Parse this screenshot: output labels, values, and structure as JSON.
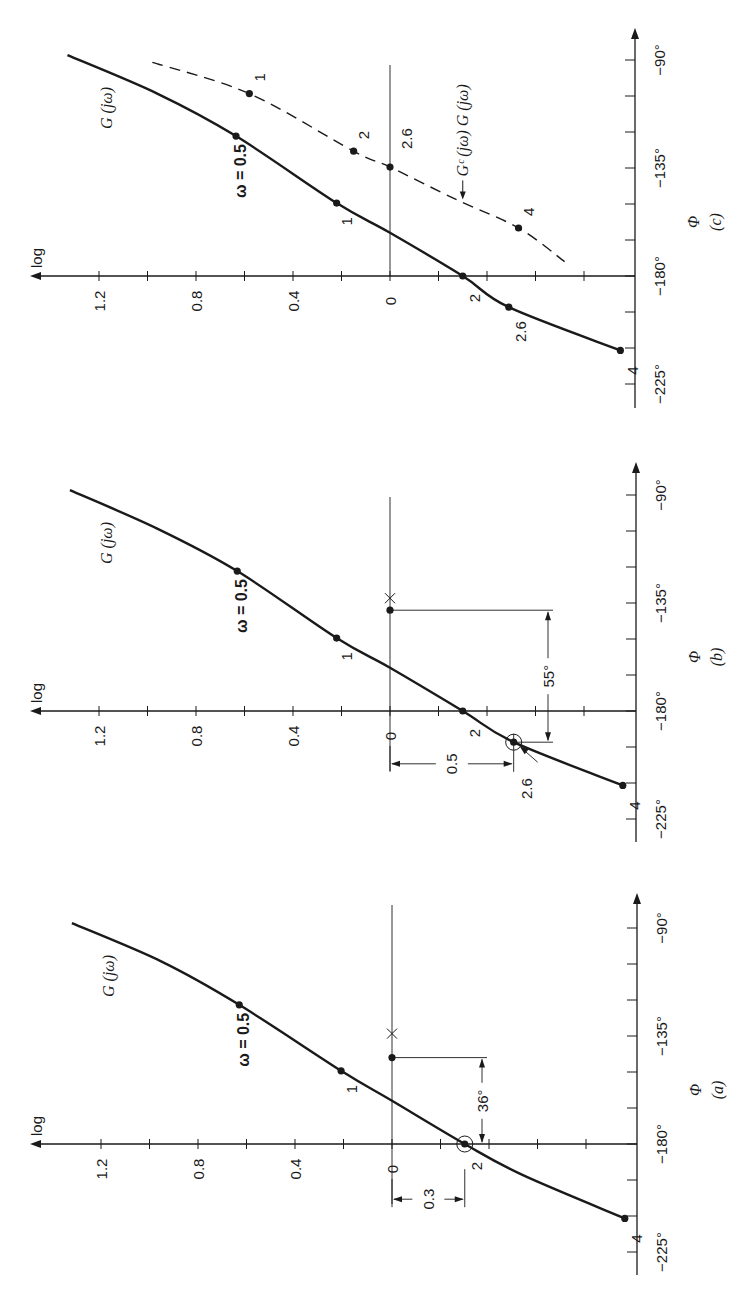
{
  "figure": {
    "ink_color": "#1a1a1a",
    "background": "#ffffff",
    "axis_labels": {
      "magnitude": "log",
      "phase_symbol": "Φ",
      "phase_ticks": [
        "−90°",
        "−135°",
        "−180°",
        "−225°"
      ],
      "magnitude_ticks": [
        "1.2",
        "0.8",
        "0.4",
        "0"
      ]
    }
  },
  "chart_data": [
    {
      "type": "line",
      "panel": "c",
      "caption": "(c)",
      "title": "",
      "xlabel": "Φ",
      "ylabel": "log",
      "xlim": [
        -232,
        -84
      ],
      "ylim": [
        -1.0,
        1.45
      ],
      "x_ticks": [
        -225,
        -210,
        -195,
        -180,
        -165,
        -150,
        -135,
        -120,
        -105,
        -90
      ],
      "x_tick_labels": {
        "-225": "−225°",
        "-180": "−180°",
        "-135": "−135°",
        "-90": "−90°"
      },
      "y_ticks": [
        1.2,
        1.0,
        0.8,
        0.6,
        0.4,
        0.2,
        0,
        -0.2,
        -0.4,
        -0.6,
        -0.8
      ],
      "y_tick_labels": {
        "1.2": "1.2",
        "0.8": "0.8",
        "0.4": "0.4",
        "0": "0"
      },
      "grid": false,
      "reference_line": {
        "log": 0,
        "label": "0"
      },
      "series": [
        {
          "name": "G (jω)",
          "style": "solid",
          "curve": [
            [
              -88,
              1.33
            ],
            [
              -104,
              0.96
            ],
            [
              -121.7,
              0.635
            ],
            [
              -149.6,
              0.22
            ],
            [
              -162,
              0.0
            ],
            [
              -180,
              -0.3
            ],
            [
              -193,
              -0.49
            ],
            [
              -211,
              -0.95
            ]
          ],
          "points": [
            {
              "omega_label": "ω = 0.5",
              "phase": -121.7,
              "log": 0.635
            },
            {
              "omega_label": "1",
              "phase": -149.6,
              "log": 0.22
            },
            {
              "omega_label": "2",
              "phase": -180,
              "log": -0.3
            },
            {
              "omega_label": "2.6",
              "phase": -193,
              "log": -0.49
            },
            {
              "omega_label": "4",
              "phase": -211,
              "log": -0.95
            }
          ]
        },
        {
          "name": "G_c (jω) G (jω)",
          "style": "dashed",
          "curve": [
            [
              -91,
              0.98
            ],
            [
              -104,
              0.58
            ],
            [
              -128,
              0.15
            ],
            [
              -134.6,
              0.0
            ],
            [
              -148,
              -0.27
            ],
            [
              -160,
              -0.53
            ],
            [
              -174,
              -0.72
            ]
          ],
          "points": [
            {
              "omega_label": "1",
              "phase": -104,
              "log": 0.58
            },
            {
              "omega_label": "2",
              "phase": -128,
              "log": 0.15
            },
            {
              "omega_label": "2.6",
              "phase": -134.6,
              "log": 0.0
            },
            {
              "omega_label": "4",
              "phase": -160,
              "log": -0.53
            }
          ]
        }
      ],
      "annotations": [
        {
          "text": "G (jω)",
          "role": "curve-label"
        },
        {
          "text": "← Gᶜ (jω) G (jω)",
          "role": "compensated-curve-label"
        }
      ]
    },
    {
      "type": "line",
      "panel": "b",
      "caption": "(b)",
      "title": "",
      "xlabel": "Φ",
      "ylabel": "log",
      "xlim": [
        -232,
        -84
      ],
      "ylim": [
        -1.0,
        1.45
      ],
      "x_ticks": [
        -225,
        -210,
        -195,
        -180,
        -165,
        -150,
        -135,
        -120,
        -105,
        -90
      ],
      "x_tick_labels": {
        "-225": "−225°",
        "-180": "−180°",
        "-135": "−135°",
        "-90": "−90°"
      },
      "y_ticks": [
        1.2,
        1.0,
        0.8,
        0.6,
        0.4,
        0.2,
        0,
        -0.2,
        -0.4,
        -0.6,
        -0.8
      ],
      "y_tick_labels": {
        "1.2": "1.2",
        "0.8": "0.8",
        "0.4": "0.4",
        "0": "0"
      },
      "grid": false,
      "reference_line": {
        "log": 0,
        "label": "0"
      },
      "series": [
        {
          "name": "G (jω)",
          "style": "solid",
          "curve": [
            [
              -88,
              1.32
            ],
            [
              -104,
              0.96
            ],
            [
              -121.7,
              0.63
            ],
            [
              -149.6,
              0.22
            ],
            [
              -162,
              0.0
            ],
            [
              -180,
              -0.3
            ],
            [
              -193,
              -0.51
            ],
            [
              -211,
              -0.96
            ]
          ],
          "points": [
            {
              "omega_label": "ω = 0.5",
              "phase": -121.7,
              "log": 0.63
            },
            {
              "omega_label": "1",
              "phase": -149.6,
              "log": 0.22
            },
            {
              "omega_label": "2",
              "phase": -180,
              "log": -0.3
            },
            {
              "omega_label": "2.6",
              "phase": -193,
              "log": -0.51,
              "circled": true
            },
            {
              "omega_label": "4",
              "phase": -211,
              "log": -0.96
            }
          ]
        }
      ],
      "markers": [
        {
          "type": "cross",
          "phase": -133,
          "log": 0.0
        },
        {
          "type": "dot",
          "phase": -138,
          "log": 0.0
        }
      ],
      "annotations": [
        {
          "text": "G (jω)",
          "role": "curve-label"
        },
        {
          "text": "55°",
          "role": "phase-margin-dimension",
          "from_phase": -193,
          "to_phase": -138
        },
        {
          "text": "0.5",
          "role": "gain-dimension",
          "from_log": 0.0,
          "to_log": -0.51
        },
        {
          "text": "2.6",
          "role": "arrow-label"
        }
      ]
    },
    {
      "type": "line",
      "panel": "a",
      "caption": "(a)",
      "title": "",
      "xlabel": "Φ",
      "ylabel": "log",
      "xlim": [
        -232,
        -84
      ],
      "ylim": [
        -1.0,
        1.45
      ],
      "x_ticks": [
        -225,
        -210,
        -195,
        -180,
        -165,
        -150,
        -135,
        -120,
        -105,
        -90
      ],
      "x_tick_labels": {
        "-225": "−225°",
        "-180": "−180°",
        "-135": "−135°",
        "-90": "−90°"
      },
      "y_ticks": [
        1.2,
        1.0,
        0.8,
        0.6,
        0.4,
        0.2,
        0,
        -0.2,
        -0.4,
        -0.6,
        -0.8
      ],
      "y_tick_labels": {
        "1.2": "1.2",
        "0.8": "0.8",
        "0.4": "0.4",
        "0": "0"
      },
      "grid": false,
      "reference_line": {
        "log": 0,
        "label": "0"
      },
      "series": [
        {
          "name": "G (jω)",
          "style": "solid",
          "curve": [
            [
              -88,
              1.32
            ],
            [
              -104,
              0.95
            ],
            [
              -122,
              0.63
            ],
            [
              -149.5,
              0.21
            ],
            [
              -162,
              0.0
            ],
            [
              -180,
              -0.3
            ],
            [
              -193,
              -0.54
            ],
            [
              -211,
              -0.96
            ]
          ],
          "points": [
            {
              "omega_label": "ω = 0.5",
              "phase": -122,
              "log": 0.63
            },
            {
              "omega_label": "1",
              "phase": -149.5,
              "log": 0.21
            },
            {
              "omega_label": "2",
              "phase": -180,
              "log": -0.3,
              "circled": true
            },
            {
              "omega_label": "4",
              "phase": -211,
              "log": -0.96
            }
          ]
        }
      ],
      "markers": [
        {
          "type": "cross",
          "phase": -134,
          "log": 0.0
        },
        {
          "type": "dot",
          "phase": -144,
          "log": 0.0
        }
      ],
      "annotations": [
        {
          "text": "G (jω)",
          "role": "curve-label"
        },
        {
          "text": "36°",
          "role": "phase-margin-dimension",
          "from_phase": -180,
          "to_phase": -144
        },
        {
          "text": "0.3",
          "role": "gain-dimension",
          "from_log": 0.0,
          "to_log": -0.3
        }
      ]
    }
  ],
  "panels_layout": [
    {
      "panel": "c",
      "x0": 390,
      "y180": 276,
      "axis_x": 635,
      "arrow_tip_y": 28,
      "axis_bottom_y": 408,
      "ref_top_y": 65,
      "label_y_offset": 0
    },
    {
      "panel": "b",
      "x0": 390,
      "y180": 711,
      "axis_x": 636,
      "arrow_tip_y": 462,
      "axis_bottom_y": 842,
      "ref_top_y": 497,
      "label_y_offset": 0
    },
    {
      "panel": "a",
      "x0": 392,
      "y180": 1144,
      "axis_x": 637,
      "arrow_tip_y": 893,
      "axis_bottom_y": 1275,
      "ref_top_y": 905,
      "label_y_offset": 0
    }
  ]
}
